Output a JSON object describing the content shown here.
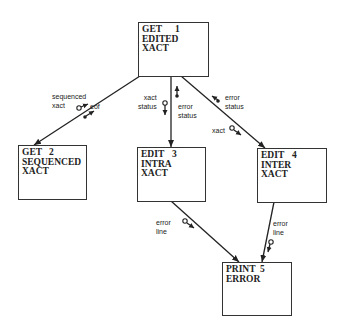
{
  "modules": [
    {
      "id": "1",
      "lines": [
        "GET",
        "EDITED",
        "XACT"
      ],
      "number": "1"
    },
    {
      "id": "2",
      "lines": [
        "GET",
        "SEQUENCED",
        "XACT"
      ],
      "number": "2"
    },
    {
      "id": "3",
      "lines": [
        "EDIT",
        "INTRA",
        "XACT"
      ],
      "number": "3"
    },
    {
      "id": "4",
      "lines": [
        "EDIT",
        "INTER",
        "XACT"
      ],
      "number": "4"
    },
    {
      "id": "5",
      "lines": [
        "PRINT",
        "ERROR"
      ],
      "number": "5"
    }
  ],
  "connections": [
    {
      "from": "1",
      "to": "2",
      "couples": [
        {
          "label": "sequenced\nxact",
          "kind": "data",
          "direction": "up"
        },
        {
          "label": "eof",
          "kind": "control",
          "direction": "up"
        }
      ]
    },
    {
      "from": "1",
      "to": "3",
      "couples": [
        {
          "label": "xact\nstatus",
          "kind": "data",
          "direction": "down"
        },
        {
          "label": "error\nstatus",
          "kind": "control",
          "direction": "up"
        }
      ]
    },
    {
      "from": "1",
      "to": "4",
      "couples": [
        {
          "label": "error\nstatus",
          "kind": "control",
          "direction": "up"
        },
        {
          "label": "xact",
          "kind": "data",
          "direction": "down"
        }
      ]
    },
    {
      "from": "3",
      "to": "5",
      "couples": [
        {
          "label": "error\nline",
          "kind": "data",
          "direction": "down"
        }
      ]
    },
    {
      "from": "4",
      "to": "5",
      "couples": [
        {
          "label": "error\nline",
          "kind": "data",
          "direction": "down"
        }
      ]
    }
  ],
  "labels": {
    "c12_data": "sequenced\nxact",
    "c12_ctrl": "eof",
    "c13_data": "xact\nstatus",
    "c13_ctrl": "error\nstatus",
    "c14_ctrl": "error\nstatus",
    "c14_data": "xact",
    "c35_data": "error\nline",
    "c45_data": "error\nline"
  }
}
